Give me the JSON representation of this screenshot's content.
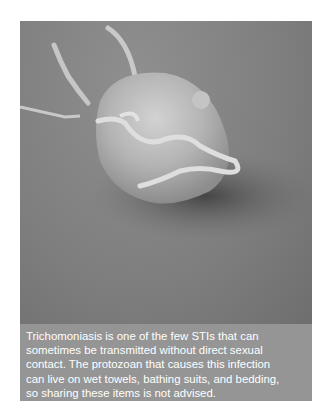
{
  "figure": {
    "image": {
      "subject": "Scanning electron micrograph of a Trichomonas vaginalis protozoan",
      "colors": {
        "background": "#7e7e7e",
        "cell": "#c4c4c4",
        "shadow": "#4a4a4a"
      }
    },
    "caption": {
      "lines": [
        "Trichomoniasis is one of the few STIs that can",
        "sometimes be transmitted without direct sexual",
        "contact. The protozoan that causes this infection",
        "can live on wet towels, bathing suits, and bedding,",
        "so sharing these items is not advised."
      ],
      "colors": {
        "background": "#959595",
        "text": "#ffffff"
      }
    }
  }
}
